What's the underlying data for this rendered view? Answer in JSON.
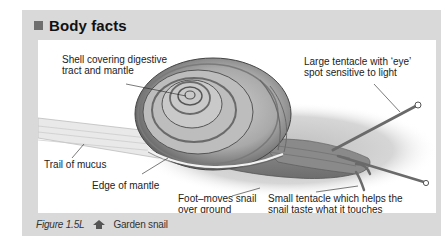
{
  "panel": {
    "title": "Body facts",
    "bullet_color": "#6f6f6f",
    "background_color": "#d9d9d9"
  },
  "figure": {
    "labels": {
      "shell": {
        "line1": "Shell covering digestive",
        "line2": "tract and mantle"
      },
      "large_tentacle": {
        "line1": "Large tentacle with ‘eye’",
        "line2": "spot sensitive to light"
      },
      "trail": {
        "line1": "Trail of mucus"
      },
      "mantle_edge": {
        "line1": "Edge of mantle"
      },
      "foot": {
        "line1": "Foot–moves snail",
        "line2": "over ground"
      },
      "small_tentacle": {
        "line1": "Small tentacle which helps the",
        "line2": "snail taste what it touches"
      }
    }
  },
  "caption": {
    "figure_number": "Figure 1.5L",
    "icon": "house-arrow-icon",
    "text": "Garden snail"
  }
}
